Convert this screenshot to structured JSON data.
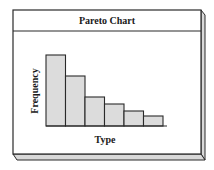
{
  "panel": {
    "title": "Pareto Chart",
    "colors": {
      "frame": "#2a2a2a",
      "face": "#ffffff",
      "bevel": "#d9d9d9",
      "bar_fill": "#dcdcdc",
      "bar_stroke": "#2a2a2a"
    }
  },
  "chart_data": {
    "type": "bar",
    "title": "Pareto Chart",
    "xlabel": "Type",
    "ylabel": "Frequency",
    "categories": [
      "1",
      "2",
      "3",
      "4",
      "5",
      "6"
    ],
    "values": [
      71,
      50,
      29,
      22,
      15,
      10
    ],
    "sorted": "descending",
    "grid": false,
    "legend": "none",
    "tick_labels_shown": false
  }
}
